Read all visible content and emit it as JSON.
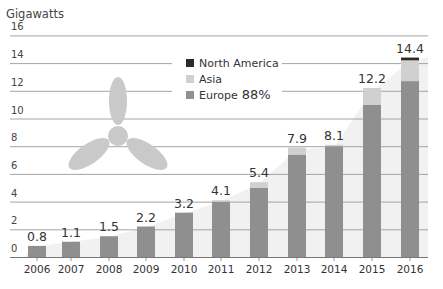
{
  "chart_data": {
    "type": "bar",
    "title": "",
    "ylabel": "Gigawatts",
    "xlabel": "",
    "ylim": [
      0,
      16
    ],
    "yticks": [
      0,
      2,
      4,
      6,
      8,
      10,
      12,
      14,
      16
    ],
    "grid": true,
    "categories": [
      "2006",
      "2007",
      "2008",
      "2009",
      "2010",
      "2011",
      "2012",
      "2013",
      "2014",
      "2015",
      "2016"
    ],
    "totals": [
      0.8,
      1.1,
      1.5,
      2.2,
      3.2,
      4.1,
      5.4,
      7.9,
      8.1,
      12.2,
      14.4
    ],
    "series": [
      {
        "name": "Europe",
        "color": "#8f8f8f",
        "values": [
          0.8,
          1.1,
          1.5,
          2.2,
          3.2,
          4.0,
          5.0,
          7.4,
          8.0,
          11.0,
          12.7
        ]
      },
      {
        "name": "Asia",
        "color": "#d0d0d0",
        "values": [
          0.0,
          0.0,
          0.0,
          0.0,
          0.0,
          0.1,
          0.4,
          0.5,
          0.1,
          1.2,
          1.5
        ]
      },
      {
        "name": "North America",
        "color": "#2a2a2a",
        "values": [
          0.0,
          0.0,
          0.0,
          0.0,
          0.0,
          0.0,
          0.0,
          0.0,
          0.0,
          0.0,
          0.2
        ]
      }
    ],
    "legend": {
      "position": "upper-center",
      "entries": [
        {
          "label": "North America",
          "color": "#2a2a2a"
        },
        {
          "label": "Asia",
          "color": "#d0d0d0"
        },
        {
          "label": "Europe",
          "color": "#8f8f8f",
          "annotation": "88%"
        }
      ]
    },
    "background_area": {
      "color": "#f1f1f1",
      "description": "light gray area rising behind bars following totals"
    },
    "decoration": "wind-turbine-icon"
  }
}
